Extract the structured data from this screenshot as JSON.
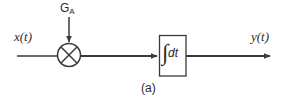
{
  "figure": {
    "caption": "(a)",
    "background_color": "#ffffff",
    "stroke_color": "#3a3a3a",
    "text_color": "#2b2b2b"
  },
  "labels": {
    "input_signal": "x(t)",
    "output_signal": "y(t)",
    "gain_symbol": "G",
    "gain_subscript": "A"
  },
  "blocks": {
    "multiplier": {
      "name": "multiplier",
      "glyph": "multiply-cross",
      "center_x": 69,
      "center_y": 55,
      "radius": 11.5
    },
    "integrator": {
      "name": "integrator",
      "integral_sign": "∫",
      "integrand": "dt",
      "x": 159,
      "y": 35,
      "width": 27,
      "height": 41
    }
  },
  "signal_paths": {
    "input_line": {
      "x1": 17,
      "y1": 56,
      "x2": 57,
      "y2": 56
    },
    "gain_line": {
      "x1": 69,
      "y1": 17,
      "x2": 69,
      "y2": 43,
      "arrow": true
    },
    "mid_line": {
      "x1": 81,
      "y1": 56,
      "x2": 159,
      "y2": 56,
      "arrow": true
    },
    "output_line": {
      "x1": 186,
      "y1": 56,
      "x2": 272,
      "y2": 56,
      "arrow": true
    }
  }
}
